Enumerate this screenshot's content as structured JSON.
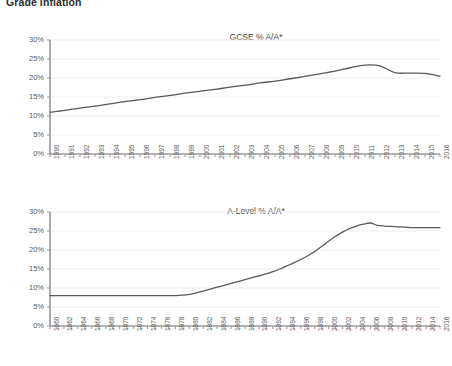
{
  "page": {
    "title": "Grade inflation"
  },
  "charts": [
    {
      "id": "gcse",
      "title": "GCSE % A/A*"
    },
    {
      "id": "alevel",
      "title": "A-Level % A/A*"
    }
  ],
  "chart_data": [
    {
      "type": "line",
      "title": "GCSE % A/A*",
      "xlabel": "",
      "ylabel": "",
      "ylim": [
        0,
        30
      ],
      "yticks": [
        0,
        5,
        10,
        15,
        20,
        25,
        30
      ],
      "ytick_labels": [
        "0%",
        "5%",
        "10%",
        "15%",
        "20%",
        "25%",
        "30%"
      ],
      "grid": true,
      "legend": "none",
      "line_color": "#595959",
      "x": [
        1990,
        1991,
        1992,
        1993,
        1994,
        1995,
        1996,
        1997,
        1998,
        1999,
        2000,
        2001,
        2002,
        2003,
        2004,
        2005,
        2006,
        2007,
        2008,
        2009,
        2010,
        2011,
        2012,
        2013,
        2014,
        2015,
        2016
      ],
      "xtick_labels": [
        "1990",
        "1991",
        "1992",
        "1993",
        "1994",
        "1995",
        "1996",
        "1997",
        "1998",
        "1999",
        "2000",
        "2001",
        "2002",
        "2003",
        "2004",
        "2005",
        "2006",
        "2007",
        "2008",
        "2009",
        "2010",
        "2011",
        "2012",
        "2013",
        "2014",
        "2015",
        "2016"
      ],
      "values": [
        11.0,
        11.5,
        12.1,
        12.6,
        13.2,
        13.8,
        14.3,
        14.9,
        15.4,
        16.0,
        16.5,
        17.0,
        17.6,
        18.1,
        18.7,
        19.2,
        19.8,
        20.4,
        21.1,
        21.8,
        22.7,
        23.4,
        23.2,
        21.4,
        21.3,
        21.2,
        20.5
      ],
      "peak": {
        "year": 2011,
        "value": 23.4
      },
      "start": {
        "year": 1990,
        "value": 11.0
      },
      "end": {
        "year": 2016,
        "value": 20.5
      }
    },
    {
      "type": "line",
      "title": "A-Level % A/A*",
      "xlabel": "",
      "ylabel": "",
      "ylim": [
        0,
        30
      ],
      "yticks": [
        0,
        5,
        10,
        15,
        20,
        25,
        30
      ],
      "ytick_labels": [
        "0%",
        "5%",
        "10%",
        "15%",
        "20%",
        "25%",
        "30%"
      ],
      "grid": true,
      "legend": "none",
      "line_color": "#595959",
      "x": [
        1960,
        1961,
        1962,
        1963,
        1964,
        1965,
        1966,
        1967,
        1968,
        1969,
        1970,
        1971,
        1972,
        1973,
        1974,
        1975,
        1976,
        1977,
        1978,
        1979,
        1980,
        1981,
        1982,
        1983,
        1984,
        1985,
        1986,
        1987,
        1988,
        1989,
        1990,
        1991,
        1992,
        1993,
        1994,
        1995,
        1996,
        1997,
        1998,
        1999,
        2000,
        2001,
        2002,
        2003,
        2004,
        2005,
        2006,
        2007,
        2008,
        2009,
        2010,
        2011,
        2012,
        2013,
        2014,
        2015,
        2016
      ],
      "xtick_labels": [
        "1960",
        "1962",
        "1964",
        "1966",
        "1968",
        "1970",
        "1972",
        "1974",
        "1976",
        "1978",
        "1980",
        "1982",
        "1984",
        "1986",
        "1988",
        "1990",
        "1992",
        "1994",
        "1996",
        "1998",
        "2000",
        "2002",
        "2004",
        "2006",
        "2008",
        "2010",
        "2012",
        "2014",
        "2016"
      ],
      "xtick_label_every": 2,
      "values": [
        8.0,
        8.0,
        8.0,
        8.0,
        8.0,
        8.0,
        8.0,
        8.0,
        8.0,
        8.0,
        8.0,
        8.0,
        8.0,
        8.0,
        8.0,
        8.0,
        8.0,
        8.0,
        8.0,
        8.1,
        8.3,
        8.7,
        9.2,
        9.7,
        10.2,
        10.7,
        11.2,
        11.7,
        12.2,
        12.7,
        13.2,
        13.7,
        14.3,
        15.0,
        15.8,
        16.6,
        17.5,
        18.5,
        19.6,
        20.9,
        22.3,
        23.6,
        24.7,
        25.6,
        26.3,
        26.8,
        27.1,
        26.5,
        26.3,
        26.2,
        26.1,
        26.0,
        25.9,
        25.9,
        25.9,
        25.9,
        25.9
      ],
      "flat_period": {
        "from": 1960,
        "to": 1979,
        "value": 8.0
      },
      "peak": {
        "year": 2006,
        "value": 27.1
      },
      "start": {
        "year": 1960,
        "value": 8.0
      },
      "end": {
        "year": 2016,
        "value": 25.9
      }
    }
  ]
}
